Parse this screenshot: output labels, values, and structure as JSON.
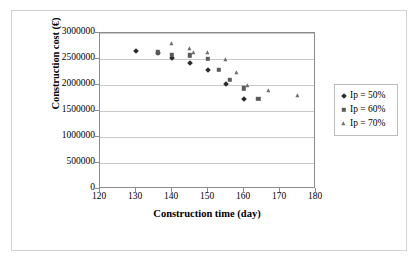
{
  "chart_data": {
    "type": "scatter",
    "title": "",
    "xlabel": "Construction time (day)",
    "ylabel": "Construction cost (€)",
    "xlim": [
      120,
      180
    ],
    "ylim": [
      0,
      3000000
    ],
    "xticks": [
      120,
      130,
      140,
      150,
      160,
      170,
      180
    ],
    "yticks": [
      0,
      500000,
      1000000,
      1500000,
      2000000,
      2500000,
      3000000
    ],
    "xtick_labels": [
      "120",
      "130",
      "140",
      "150",
      "160",
      "170",
      "180"
    ],
    "ytick_labels": [
      "0",
      "500000",
      "1000000",
      "1500000",
      "2000000",
      "2500000",
      "3000000"
    ],
    "grid": "horizontal",
    "legend_position": "right-outside",
    "series": [
      {
        "name": "Ip = 50%",
        "marker": "diamond",
        "color": "#2b2b2b",
        "points": [
          [
            130,
            2650000
          ],
          [
            136,
            2620000
          ],
          [
            140,
            2520000
          ],
          [
            145,
            2430000
          ],
          [
            150,
            2280000
          ],
          [
            155,
            2010000
          ],
          [
            160,
            1730000
          ]
        ]
      },
      {
        "name": "Ip = 60%",
        "marker": "square",
        "color": "#5a5a5a",
        "points": [
          [
            136,
            2630000
          ],
          [
            140,
            2580000
          ],
          [
            145,
            2570000
          ],
          [
            150,
            2500000
          ],
          [
            153,
            2290000
          ],
          [
            156,
            2100000
          ],
          [
            160,
            1940000
          ],
          [
            164,
            1740000
          ]
        ]
      },
      {
        "name": "Ip = 70%",
        "marker": "triangle",
        "color": "#6e6e6e",
        "points": [
          [
            140,
            2790000
          ],
          [
            145,
            2700000
          ],
          [
            146,
            2610000
          ],
          [
            150,
            2610000
          ],
          [
            155,
            2490000
          ],
          [
            158,
            2230000
          ],
          [
            161,
            1990000
          ],
          [
            167,
            1890000
          ],
          [
            175,
            1780000
          ]
        ]
      }
    ]
  },
  "legend": {
    "items": [
      {
        "label": "Ip = 50%",
        "marker": "diamond"
      },
      {
        "label": "Ip = 60%",
        "marker": "square"
      },
      {
        "label": "Ip = 70%",
        "marker": "triangle"
      }
    ]
  }
}
